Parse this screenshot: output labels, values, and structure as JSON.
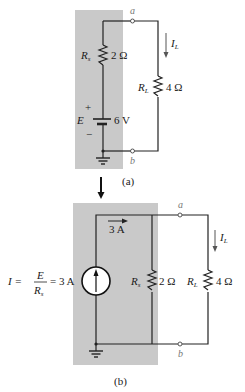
{
  "diagram": {
    "type": "circuit-source-conversion",
    "panel_a": {
      "caption": "(a)",
      "source_resistor": {
        "symbol": "R",
        "subscript": "s",
        "value": "2 Ω"
      },
      "load_resistor": {
        "symbol": "R",
        "subscript": "L",
        "value": "4 Ω"
      },
      "voltage_source": {
        "symbol": "E",
        "value": "6 V",
        "plus": "+",
        "minus": "−"
      },
      "terminal_top": "a",
      "terminal_bottom": "b",
      "load_current": {
        "symbol": "I",
        "subscript": "L"
      }
    },
    "panel_b": {
      "caption": "(b)",
      "current_source": {
        "equation_lhs": "I =",
        "frac_num": "E",
        "frac_den_symbol": "R",
        "frac_den_sub": "s",
        "equation_rhs": "= 3 A"
      },
      "branch_current": "3 A",
      "source_resistor": {
        "symbol": "R",
        "subscript": "s",
        "value": "2 Ω"
      },
      "load_resistor": {
        "symbol": "R",
        "subscript": "L",
        "value": "4 Ω"
      },
      "terminal_top": "a",
      "terminal_bottom": "b",
      "load_current": {
        "symbol": "I",
        "subscript": "L"
      }
    },
    "colors": {
      "shade": "#c9c9c9",
      "wire": "#222222",
      "terminal_label": "#777777"
    }
  }
}
